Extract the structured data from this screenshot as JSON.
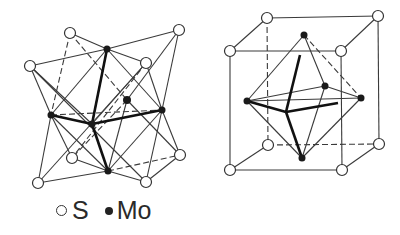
{
  "figure": {
    "left_structure": {
      "description": "MoS2 trigonal prismatic coordination (2H)",
      "open_atoms": [
        [
          70,
          33
        ],
        [
          179,
          30
        ],
        [
          30,
          66
        ],
        [
          146,
          63
        ],
        [
          72,
          158
        ],
        [
          180,
          155
        ],
        [
          38,
          183
        ],
        [
          146,
          182
        ]
      ],
      "filled_atoms": [
        [
          107,
          49
        ],
        [
          51,
          115
        ],
        [
          92,
          124
        ],
        [
          127,
          100
        ],
        [
          162,
          110
        ],
        [
          108,
          171
        ]
      ]
    },
    "right_structure": {
      "description": "octahedral coordination in cube",
      "open_atoms": [
        [
          267,
          18
        ],
        [
          378,
          16
        ],
        [
          230,
          51
        ],
        [
          341,
          51
        ],
        [
          268,
          145
        ],
        [
          379,
          144
        ],
        [
          230,
          170
        ],
        [
          342,
          170
        ]
      ],
      "filled_atoms": [
        [
          304,
          35
        ],
        [
          247,
          101
        ],
        [
          325,
          86
        ],
        [
          361,
          98
        ],
        [
          302,
          158
        ]
      ]
    },
    "legend": {
      "items": [
        {
          "symbol": "open-circle",
          "label": "S"
        },
        {
          "symbol": "filled-circle",
          "label": "Mo"
        }
      ]
    },
    "colors": {
      "line": "#333333",
      "atom_fill": "#222222",
      "background": "#ffffff"
    }
  }
}
